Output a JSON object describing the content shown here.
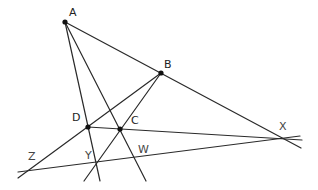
{
  "diagram": {
    "type": "geometric-construction",
    "points": [
      {
        "name": "A",
        "x": 65,
        "y": 22,
        "label_x": 69,
        "label_y": 16,
        "dot": true
      },
      {
        "name": "B",
        "x": 161,
        "y": 73,
        "label_x": 164,
        "label_y": 68,
        "dot": true
      },
      {
        "name": "C",
        "x": 120,
        "y": 129,
        "label_x": 131,
        "label_y": 124,
        "dot": true
      },
      {
        "name": "D",
        "x": 88,
        "y": 127,
        "label_x": 72,
        "label_y": 121,
        "dot": true
      },
      {
        "name": "X",
        "x": 283,
        "y": 139,
        "label_x": 279,
        "label_y": 130,
        "dot": false
      },
      {
        "name": "Y",
        "x": 95,
        "y": 162,
        "label_x": 85,
        "label_y": 159,
        "dot": false
      },
      {
        "name": "W",
        "x": 135,
        "y": 157,
        "label_x": 138,
        "label_y": 153,
        "dot": false
      },
      {
        "name": "Z",
        "x": 29,
        "y": 170,
        "label_x": 28,
        "label_y": 160,
        "dot": false
      }
    ],
    "lines": [
      {
        "name": "line-AX",
        "through": [
          "A",
          "B",
          "X"
        ],
        "x1": 65,
        "y1": 22,
        "x2": 301,
        "y2": 148
      },
      {
        "name": "line-AD",
        "through": [
          "A",
          "D",
          "Y"
        ],
        "x1": 65,
        "y1": 22,
        "x2": 100,
        "y2": 181
      },
      {
        "name": "line-AC",
        "through": [
          "A",
          "C",
          "W"
        ],
        "x1": 65,
        "y1": 22,
        "x2": 146,
        "y2": 181
      },
      {
        "name": "line-BZ",
        "through": [
          "B",
          "D",
          "Z"
        ],
        "x1": 161,
        "y1": 73,
        "x2": 18,
        "y2": 178
      },
      {
        "name": "line-BY",
        "through": [
          "B",
          "C",
          "Y"
        ],
        "x1": 161,
        "y1": 73,
        "x2": 84,
        "y2": 181
      },
      {
        "name": "line-DX",
        "through": [
          "D",
          "C",
          "X"
        ],
        "x1": 88,
        "y1": 127,
        "x2": 302,
        "y2": 140
      },
      {
        "name": "line-ZX",
        "through": [
          "Z",
          "Y",
          "W",
          "X"
        ],
        "x1": 18,
        "y1": 172,
        "x2": 300,
        "y2": 136
      }
    ]
  }
}
